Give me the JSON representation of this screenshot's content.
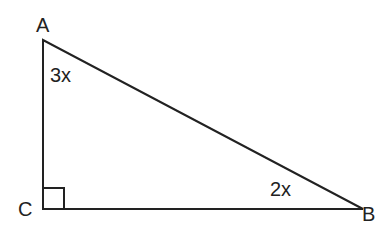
{
  "diagram": {
    "type": "right-triangle",
    "vertices": {
      "A": {
        "label": "A"
      },
      "B": {
        "label": "B"
      },
      "C": {
        "label": "C"
      }
    },
    "angles": {
      "A": {
        "label": "3x"
      },
      "B": {
        "label": "2x"
      },
      "C": {
        "label": "right-angle"
      }
    },
    "colors": {
      "stroke": "#222222",
      "background": "#ffffff"
    }
  }
}
